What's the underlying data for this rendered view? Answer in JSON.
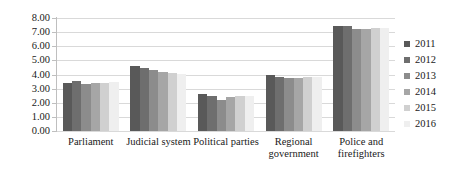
{
  "chart_data": {
    "type": "bar",
    "title": "",
    "xlabel": "",
    "ylabel": "",
    "ylim": [
      0,
      8
    ],
    "ytick_step": 1,
    "ytick_labels": [
      "8.00",
      "7.00",
      "6.00",
      "5.00",
      "4.00",
      "3.00",
      "2.00",
      "1.00",
      "0.00"
    ],
    "grid": true,
    "legend_position": "right",
    "categories": [
      "Parliament",
      "Judicial system",
      "Political parties",
      "Regional government",
      "Police and firefighters"
    ],
    "series": [
      {
        "name": "2011",
        "color": "#595959",
        "values": [
          3.4,
          4.6,
          2.6,
          3.95,
          7.45
        ]
      },
      {
        "name": "2012",
        "color": "#6e6e6e",
        "values": [
          3.55,
          4.45,
          2.45,
          3.8,
          7.4
        ]
      },
      {
        "name": "2013",
        "color": "#8c8c8c",
        "values": [
          3.3,
          4.3,
          2.2,
          3.75,
          7.2
        ]
      },
      {
        "name": "2014",
        "color": "#a6a6a6",
        "values": [
          3.4,
          4.2,
          2.4,
          3.75,
          7.2
        ]
      },
      {
        "name": "2015",
        "color": "#d0d0d0",
        "values": [
          3.4,
          4.1,
          2.45,
          3.8,
          7.3
        ]
      },
      {
        "name": "2016",
        "color": "#efefef",
        "values": [
          3.45,
          4.05,
          2.5,
          3.85,
          7.3
        ]
      }
    ]
  },
  "legend": {
    "items": [
      {
        "label": "2011"
      },
      {
        "label": "2012"
      },
      {
        "label": "2013"
      },
      {
        "label": "2014"
      },
      {
        "label": "2015"
      },
      {
        "label": "2016"
      }
    ]
  }
}
